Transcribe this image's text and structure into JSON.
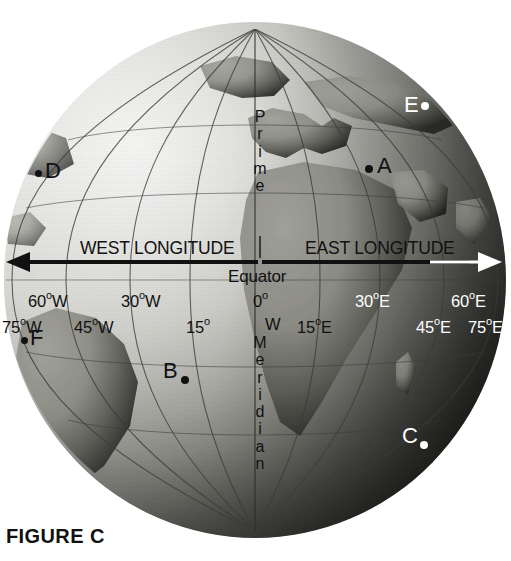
{
  "figure": {
    "caption": "FIGURE C",
    "hemisphere_labels": {
      "west": "WEST LONGITUDE",
      "east": "EAST LONGITUDE"
    },
    "equator_label": "Equator",
    "prime_meridian_vertical": {
      "top_word": "Prime",
      "bottom_word": "Meridian",
      "top_letters": [
        "P",
        "r",
        "i",
        "m",
        "e"
      ],
      "bottom_letters": [
        "M",
        "e",
        "r",
        "i",
        "d",
        "i",
        "a",
        "n"
      ]
    },
    "meridian_abbrev": {
      "west_letter": "W",
      "center_zero": "0",
      "center_zero_degree": "o",
      "meridian_initial": "M"
    },
    "longitude_ticks_upper": [
      {
        "id": "tick-60w",
        "text": "60",
        "deg": "o",
        "suffix": "W",
        "color": "dark",
        "x": 28,
        "y": 290
      },
      {
        "id": "tick-30w",
        "text": "30",
        "deg": "o",
        "suffix": "W",
        "color": "dark",
        "x": 121,
        "y": 290
      },
      {
        "id": "tick-0",
        "text": "0",
        "deg": "o",
        "suffix": "",
        "color": "dark",
        "x": 253,
        "y": 290
      },
      {
        "id": "tick-30e",
        "text": "30",
        "deg": "o",
        "suffix": "E",
        "color": "light",
        "x": 355,
        "y": 290
      },
      {
        "id": "tick-60e",
        "text": "60",
        "deg": "o",
        "suffix": "E",
        "color": "light",
        "x": 451,
        "y": 290
      }
    ],
    "longitude_ticks_lower": [
      {
        "id": "tick-75w",
        "text": "75",
        "deg": "o",
        "suffix": "W",
        "color": "dark",
        "x": 2,
        "y": 316
      },
      {
        "id": "tick-45w",
        "text": "45",
        "deg": "o",
        "suffix": "W",
        "color": "dark",
        "x": 74,
        "y": 316
      },
      {
        "id": "tick-15w",
        "text": "15",
        "deg": "o",
        "suffix": "",
        "suffix2": "",
        "color": "dark",
        "x": 186,
        "y": 316
      },
      {
        "id": "tick-15e",
        "text": "15",
        "deg": "o",
        "suffix": "E",
        "color": "dark",
        "x": 297,
        "y": 316
      },
      {
        "id": "tick-45e",
        "text": "45",
        "deg": "o",
        "suffix": "E",
        "color": "light",
        "x": 416,
        "y": 316
      },
      {
        "id": "tick-75e",
        "text": "75",
        "deg": "o",
        "suffix": "E",
        "color": "light",
        "x": 468,
        "y": 316
      }
    ],
    "points": [
      {
        "id": "point-a",
        "label": "A",
        "color": "dark",
        "label_x": 378,
        "label_y": 158,
        "dot_x": 368,
        "dot_y": 168,
        "dot_r": 5
      },
      {
        "id": "point-b",
        "label": "B",
        "color": "dark",
        "label_x": 163,
        "label_y": 362,
        "dot_x": 183,
        "dot_y": 378,
        "dot_r": 5
      },
      {
        "id": "point-c",
        "label": "C",
        "color": "light",
        "label_x": 402,
        "label_y": 427,
        "dot_x": 421,
        "dot_y": 443,
        "dot_r": 5
      },
      {
        "id": "point-d",
        "label": "D",
        "color": "dark",
        "label_x": 45,
        "label_y": 160,
        "dot_x": 37,
        "dot_y": 172,
        "dot_r": 5
      },
      {
        "id": "point-e",
        "label": "E",
        "color": "light",
        "label_x": 405,
        "label_y": 98,
        "dot_x": 424,
        "dot_y": 106,
        "dot_r": 5
      },
      {
        "id": "point-f",
        "label": "F",
        "color": "dark",
        "label_x": 30,
        "label_y": 330,
        "dot_x": 23,
        "dot_y": 340,
        "dot_r": 5
      }
    ],
    "colors": {
      "ink_dark": "#111111",
      "ink_light": "#ffffff",
      "page_background": "#ffffff"
    }
  }
}
